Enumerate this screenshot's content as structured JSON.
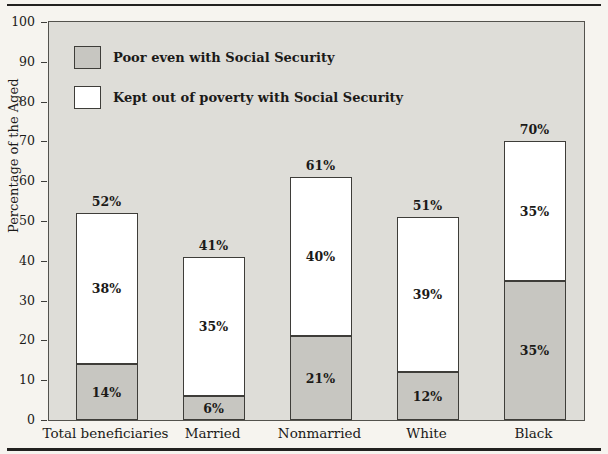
{
  "chart_data": {
    "type": "bar",
    "stacked": true,
    "categories": [
      "Total beneficiaries",
      "Married",
      "Nonmarried",
      "White",
      "Black"
    ],
    "series": [
      {
        "name": "Poor even with Social Security",
        "color": "#c7c6c1",
        "values": [
          14,
          6,
          21,
          12,
          35
        ]
      },
      {
        "name": "Kept out of poverty with Social Security",
        "color": "#ffffff",
        "values": [
          38,
          35,
          40,
          39,
          35
        ]
      }
    ],
    "totals": [
      52,
      41,
      61,
      51,
      70
    ],
    "data_label_format": "percent",
    "title": "",
    "xlabel": "",
    "ylabel": "Percentage of the Aged",
    "ylim": [
      0,
      100
    ],
    "yticks": [
      0,
      10,
      20,
      30,
      40,
      50,
      60,
      70,
      80,
      90,
      100
    ],
    "grid": false,
    "legend_position": "top-left"
  },
  "colors": {
    "page_background": "#f6f4ef",
    "plot_background": "#deddd8",
    "plot_border": "#53524d",
    "bar_border": "#3e3d39",
    "poor_fill": "#c7c6c1",
    "kept_fill": "#ffffff",
    "text": "#1b1a18",
    "rule": "#22211f"
  }
}
